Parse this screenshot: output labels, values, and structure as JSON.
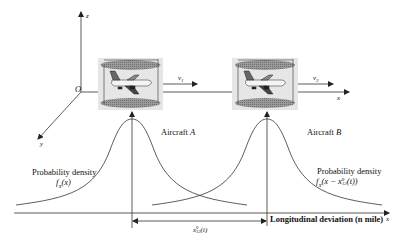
{
  "axes": {
    "origin_label": "O",
    "z_label": "z",
    "y_label": "y",
    "x_label_top": "x",
    "x_label_bottom": "x"
  },
  "aircraft": [
    {
      "name": "Aircraft",
      "id": "A",
      "velocity_label": "v1",
      "velocity_main": "v",
      "velocity_sub": "1",
      "density_title": "Probability density",
      "density_formula": "f_X(x)",
      "density_f": "f",
      "density_sub": "X",
      "density_arg": "(x)"
    },
    {
      "name": "Aircraft",
      "id": "B",
      "velocity_label": "v2",
      "velocity_main": "v",
      "velocity_sub": "2",
      "density_title": "Probability density",
      "density_formula": "f_X(x - x_12^0(t))",
      "density_f": "f",
      "density_sub": "X",
      "density_arg": "(x − x",
      "density_arg_sup": "0",
      "density_arg_sub": "12",
      "density_arg_tail": "(t))"
    }
  ],
  "bottom_axis": {
    "label": "Longitudinal deviation (n mile)"
  },
  "separation": {
    "label": "x12^0(t)",
    "main": "x",
    "sup": "0",
    "sub": "12",
    "tail": "(t)"
  },
  "colors": {
    "line": "#333333",
    "box_fill": "#e4e4e4",
    "disc_fill": "#8c8c8c"
  }
}
